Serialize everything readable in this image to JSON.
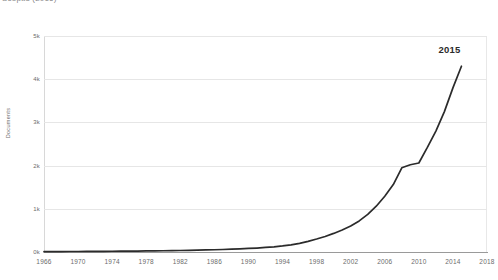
{
  "chart_data": {
    "type": "line",
    "title": "Scopus (2016)",
    "xlabel": "",
    "ylabel": "Documents",
    "xlim": [
      1966,
      2018
    ],
    "ylim": [
      0,
      5000
    ],
    "grid": true,
    "legend": "none",
    "xticks": [
      "1966",
      "1970",
      "1974",
      "1978",
      "1982",
      "1986",
      "1990",
      "1994",
      "1998",
      "2002",
      "2006",
      "2010",
      "2014",
      "2018"
    ],
    "xtick_values": [
      1966,
      1970,
      1974,
      1978,
      1982,
      1986,
      1990,
      1994,
      1998,
      2002,
      2006,
      2010,
      2014,
      2018
    ],
    "yticks": [
      "0k",
      "1k",
      "2k",
      "3k",
      "4k",
      "5k"
    ],
    "ytick_values": [
      0,
      1000,
      2000,
      3000,
      4000,
      5000
    ],
    "annotations": [
      {
        "label": "2015",
        "x": 2015,
        "y": 4300
      }
    ],
    "line_color": "#2b2b2b",
    "grid_color": "#e6e6e6",
    "x": [
      1966,
      1967,
      1968,
      1969,
      1970,
      1971,
      1972,
      1973,
      1974,
      1975,
      1976,
      1977,
      1978,
      1979,
      1980,
      1981,
      1982,
      1983,
      1984,
      1985,
      1986,
      1987,
      1988,
      1989,
      1990,
      1991,
      1992,
      1993,
      1994,
      1995,
      1996,
      1997,
      1998,
      1999,
      2000,
      2001,
      2002,
      2003,
      2004,
      2005,
      2006,
      2007,
      2008,
      2009,
      2010,
      2011,
      2012,
      2013,
      2014,
      2015
    ],
    "values": [
      8,
      9,
      10,
      11,
      12,
      13,
      14,
      15,
      17,
      18,
      20,
      22,
      24,
      26,
      29,
      32,
      35,
      38,
      42,
      47,
      52,
      58,
      65,
      73,
      82,
      92,
      105,
      120,
      140,
      165,
      200,
      245,
      300,
      360,
      430,
      510,
      600,
      720,
      870,
      1060,
      1290,
      1560,
      1950,
      2020,
      2060,
      2420,
      2800,
      3250,
      3800,
      4300
    ],
    "series_name": "Documents"
  }
}
